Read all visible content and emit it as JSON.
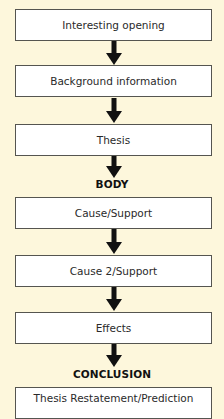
{
  "diagram": {
    "type": "essay-structure-flowchart",
    "colors": {
      "background": "#fdf7dc",
      "box_fill": "#ffffff",
      "box_border": "#555550",
      "arrow": "#111111",
      "text": "#2a2a2a"
    },
    "sections": {
      "introduction": "INTRODUCTION",
      "body": "BODY",
      "conclusion": "CONCLUSION"
    },
    "nodes": [
      {
        "id": "interesting-opening",
        "label": "Interesting opening",
        "section": "introduction"
      },
      {
        "id": "background-information",
        "label": "Background information",
        "section": "introduction"
      },
      {
        "id": "thesis",
        "label": "Thesis",
        "section": "introduction"
      },
      {
        "id": "cause-support",
        "label": "Cause/Support",
        "section": "body"
      },
      {
        "id": "cause-2-support",
        "label": "Cause 2/Support",
        "section": "body"
      },
      {
        "id": "effects",
        "label": "Effects",
        "section": "body"
      },
      {
        "id": "thesis-restatement",
        "label": "Thesis Restatement/Prediction",
        "section": "conclusion"
      }
    ],
    "edges": [
      {
        "from": "interesting-opening",
        "to": "background-information"
      },
      {
        "from": "background-information",
        "to": "thesis"
      },
      {
        "from": "thesis",
        "to": "cause-support"
      },
      {
        "from": "cause-support",
        "to": "cause-2-support"
      },
      {
        "from": "cause-2-support",
        "to": "effects"
      },
      {
        "from": "effects",
        "to": "thesis-restatement"
      }
    ]
  }
}
